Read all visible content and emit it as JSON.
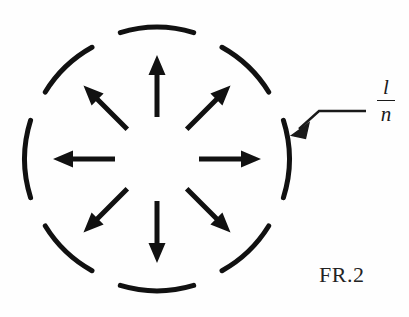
{
  "figure": {
    "caption": "FR.2",
    "background_color": "#fefefe",
    "ink_color": "#111111"
  },
  "callout": {
    "label_numerator": "l",
    "label_denominator": "n",
    "target": "circle-arc-segment-right",
    "leader_line_color": "#1a1a1a"
  },
  "diagram": {
    "circle": {
      "center_x": 157,
      "center_y": 159,
      "radius": 128,
      "stroke_width": 5,
      "segment_count": 8,
      "segment_arc_degrees": 33,
      "gap_arc_degrees": 12,
      "segment_center_angles_deg": [
        270,
        315,
        0,
        45,
        90,
        135,
        180,
        225
      ]
    },
    "arrows": {
      "count": 8,
      "direction": "outward-radial",
      "inner_radius": 42,
      "outer_radius": 104,
      "shaft_width": 5,
      "head_length": 20,
      "head_width": 17,
      "angles_deg": [
        270,
        315,
        0,
        45,
        90,
        135,
        180,
        225
      ],
      "labels": [
        "arrow-up",
        "arrow-up-right",
        "arrow-right",
        "arrow-down-right",
        "arrow-down",
        "arrow-down-left",
        "arrow-left",
        "arrow-up-left"
      ]
    }
  }
}
